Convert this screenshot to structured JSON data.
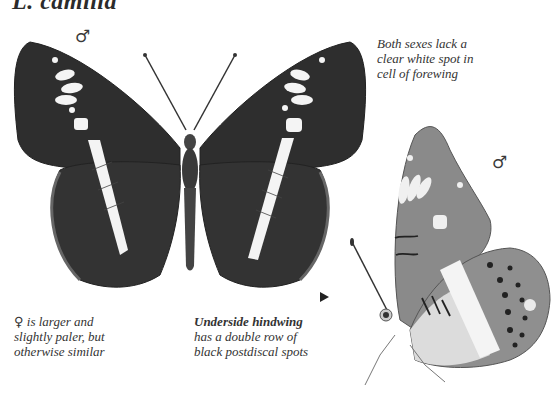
{
  "title": "L. camilla",
  "symbols": {
    "male_upperside": "♂",
    "male_underside": "♂",
    "female": "♀"
  },
  "captions": {
    "forewing_note": [
      "Both sexes lack a",
      "clear white spot in",
      "cell of forewing"
    ],
    "female_note": {
      "lead": "is larger and",
      "lines": [
        "slightly paler, but",
        "otherwise similar"
      ]
    },
    "underside_note": {
      "heading": "Underside hindwing",
      "lines": [
        "has a double row of",
        "black postdiscal spots"
      ]
    }
  },
  "illustrations": {
    "upperside": "male-upperside-specimen",
    "underside": "male-underside-specimen"
  },
  "colors": {
    "wing_dark": "#2e2e2e",
    "wing_band": "#f4f4f4",
    "underside_wing": "#8a8a8a",
    "underside_light": "#dcdcdc"
  }
}
